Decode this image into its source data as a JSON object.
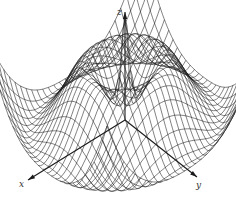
{
  "figure": {
    "type": "3d-wireframe-surface",
    "background": "#ffffff",
    "line_color": "#1a1a1a",
    "axes": {
      "x": {
        "label": "x",
        "label_pos": [
          19,
          187
        ],
        "from": [
          125,
          120
        ],
        "to": [
          28,
          180
        ]
      },
      "y": {
        "label": "y",
        "label_pos": [
          196,
          188
        ],
        "from": [
          125,
          120
        ],
        "to": [
          197,
          177
        ]
      },
      "z": {
        "label": "z",
        "label_pos": [
          117,
          15
        ],
        "from": [
          125,
          120
        ],
        "to": [
          125,
          12
        ]
      }
    }
  },
  "chart_data": {
    "type": "surface",
    "title": "",
    "xlabel": "x",
    "ylabel": "y",
    "zlabel": "z",
    "function": "z = cos(r) style radial oscillation, r = sqrt(x^2 + y^2)",
    "grid_lines_per_direction": 28,
    "domain": [
      -1,
      1
    ],
    "features": [
      "central spike",
      "annular trough",
      "annular ridge",
      "outer trough",
      "raised corners"
    ]
  }
}
